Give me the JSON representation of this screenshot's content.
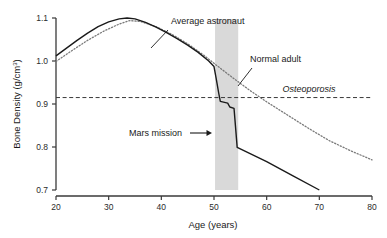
{
  "chart_data": {
    "type": "line",
    "title": "",
    "xlabel": "Age (years)",
    "ylabel": "Bone Density (g/cm3)",
    "ylabel_main": "Bone Density (g/cm",
    "ylabel_sup": "3",
    "ylabel_tail": ")",
    "xlim": [
      20,
      80
    ],
    "ylim": [
      0.7,
      1.1
    ],
    "xticks": [
      20,
      30,
      40,
      50,
      60,
      70,
      80
    ],
    "xtick_labels": [
      "20",
      "30",
      "40",
      "50",
      "60",
      "70",
      "80"
    ],
    "yticks": [
      0.7,
      0.8,
      0.9,
      1.0,
      1.1
    ],
    "ytick_labels": [
      "0.7",
      "0.8",
      "0.9",
      "1.0",
      "1.1"
    ],
    "grid": false,
    "legend_position": "inline-annotations",
    "series": [
      {
        "name": "Average astronaut",
        "style": "solid",
        "color": "#1a1a1a",
        "points": [
          [
            20,
            1.012
          ],
          [
            22,
            1.03
          ],
          [
            24,
            1.048
          ],
          [
            26,
            1.065
          ],
          [
            28,
            1.08
          ],
          [
            30,
            1.091
          ],
          [
            32,
            1.098
          ],
          [
            33.5,
            1.1
          ],
          [
            35,
            1.098
          ],
          [
            37,
            1.09
          ],
          [
            39,
            1.079
          ],
          [
            41,
            1.066
          ],
          [
            43,
            1.052
          ],
          [
            45,
            1.037
          ],
          [
            47,
            1.02
          ],
          [
            49,
            1.0
          ],
          [
            50,
            0.987
          ],
          [
            50.4,
            0.96
          ],
          [
            50.9,
            0.925
          ],
          [
            51.2,
            0.906
          ],
          [
            52.6,
            0.902
          ],
          [
            53.0,
            0.893
          ],
          [
            53.8,
            0.89
          ],
          [
            54.1,
            0.845
          ],
          [
            54.4,
            0.799
          ],
          [
            60,
            0.766
          ],
          [
            65,
            0.733
          ],
          [
            70,
            0.7
          ]
        ]
      },
      {
        "name": "Normal adult",
        "style": "dotted",
        "color": "#7a7a7a",
        "points": [
          [
            20,
            0.999
          ],
          [
            23,
            1.024
          ],
          [
            26,
            1.048
          ],
          [
            29,
            1.069
          ],
          [
            32,
            1.086
          ],
          [
            34,
            1.094
          ],
          [
            36,
            1.092
          ],
          [
            39,
            1.08
          ],
          [
            42,
            1.062
          ],
          [
            45,
            1.04
          ],
          [
            48,
            1.014
          ],
          [
            51,
            0.985
          ],
          [
            54,
            0.957
          ],
          [
            57,
            0.93
          ],
          [
            60,
            0.905
          ],
          [
            64,
            0.874
          ],
          [
            68,
            0.843
          ],
          [
            72,
            0.814
          ],
          [
            76,
            0.791
          ],
          [
            80,
            0.77
          ]
        ]
      }
    ],
    "threshold_line": {
      "name": "Osteoporosis",
      "style": "dashed",
      "value": 0.915,
      "color": "#3a3a3a"
    },
    "shaded_band": {
      "name": "Mars mission",
      "x_start": 50.2,
      "x_end": 54.6,
      "color": "#d9d9d9"
    },
    "annotations": [
      {
        "id": "average-astronaut",
        "text": "Average astronaut",
        "text_x": 171,
        "text_y": 24,
        "leader": [
          [
            168,
            30
          ],
          [
            151,
            48
          ]
        ]
      },
      {
        "id": "normal-adult",
        "text": "Normal adult",
        "text_x": 250,
        "text_y": 62,
        "leader": [
          [
            252,
            68
          ],
          [
            238,
            86
          ]
        ]
      },
      {
        "id": "osteoporosis",
        "text": "Osteoporosis",
        "text_x": 309,
        "text_y": 92,
        "italic": true
      },
      {
        "id": "mars-mission",
        "text": "Mars mission",
        "text_x": 129,
        "text_y": 136,
        "arrow": [
          [
            190,
            133
          ],
          [
            212,
            133
          ]
        ]
      }
    ]
  }
}
